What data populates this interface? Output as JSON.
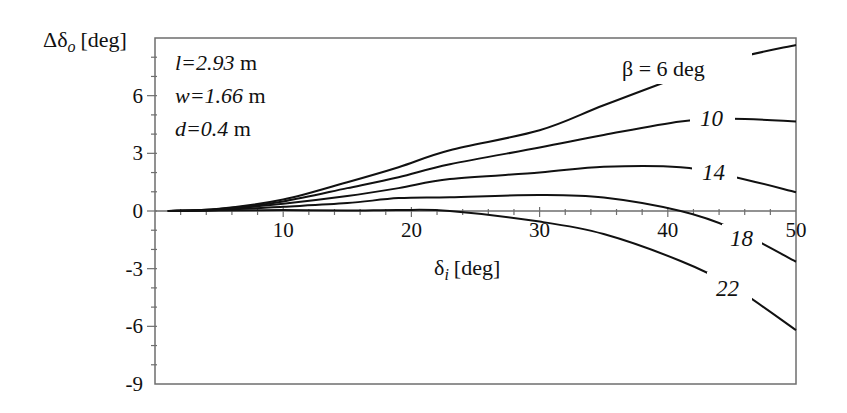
{
  "chart_data": {
    "type": "line",
    "title": "",
    "xlabel": "δi [deg]",
    "xlabel_main": "δ",
    "xlabel_sub": "i",
    "xlabel_unit": "[deg]",
    "ylabel": "Δδo [deg]",
    "ylabel_main": "Δδ",
    "ylabel_sub": "o",
    "ylabel_unit": "[deg]",
    "xlim": [
      0,
      50
    ],
    "ylim": [
      -9,
      9
    ],
    "xticks": [
      10,
      20,
      30,
      40,
      50
    ],
    "yticks": [
      6,
      3,
      0,
      -3,
      -6,
      -9
    ],
    "grid": false,
    "legend": "inline curve labels",
    "annotations": [
      {
        "var": "l",
        "value": "=2.93",
        "unit": " m"
      },
      {
        "var": "w",
        "value": "=1.66",
        "unit": " m"
      },
      {
        "var": "d",
        "value": "=0.4",
        "unit": " m"
      }
    ],
    "x": [
      1,
      5,
      10,
      15,
      19,
      23,
      30,
      35,
      41,
      45,
      50
    ],
    "series": [
      {
        "name": "β = 6 deg",
        "label": "β = 6 deg",
        "values": [
          0.0,
          0.12,
          0.6,
          1.5,
          2.28,
          3.16,
          4.2,
          5.5,
          7.0,
          7.9,
          8.64
        ]
      },
      {
        "name": "10",
        "label": "10",
        "values": [
          0.0,
          0.1,
          0.5,
          1.19,
          1.76,
          2.43,
          3.3,
          3.95,
          4.66,
          4.8,
          4.66
        ]
      },
      {
        "name": "14",
        "label": "14",
        "values": [
          0.0,
          0.08,
          0.38,
          0.78,
          1.19,
          1.66,
          2.0,
          2.3,
          2.28,
          1.8,
          0.98
        ]
      },
      {
        "name": "18",
        "label": "18",
        "values": [
          0.0,
          0.05,
          0.22,
          0.41,
          0.67,
          0.72,
          0.83,
          0.7,
          0.0,
          -0.9,
          -2.64
        ]
      },
      {
        "name": "22",
        "label": "22",
        "values": [
          0.0,
          0.02,
          0.05,
          0.02,
          0.05,
          0.0,
          -0.55,
          -1.2,
          -2.6,
          -3.9,
          -6.2
        ]
      }
    ]
  }
}
